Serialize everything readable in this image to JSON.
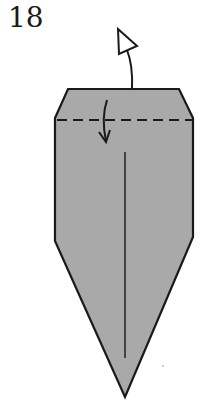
{
  "diagram": {
    "step_number": "18",
    "paper_fill": "#a9a9a9",
    "stroke_color": "#1a1a1a",
    "instructions": {
      "valley_fold_line": "dashed horizontal line near top",
      "fold_arrow": "curved arrow down (fold top edge down)",
      "unfold_arrow": "hollow arrow pointing up (unfold/turn)"
    }
  }
}
